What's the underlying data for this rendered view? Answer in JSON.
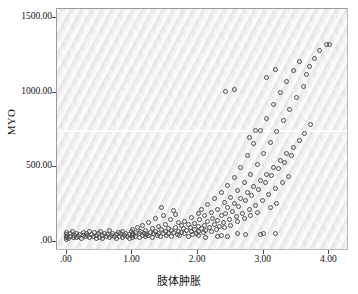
{
  "chart_data": {
    "type": "scatter",
    "title": "",
    "xlabel": "肢体肿胀",
    "ylabel": "MYO",
    "xlim": [
      -0.15,
      4.3
    ],
    "ylim": [
      -60,
      1560
    ],
    "xticks": [
      0,
      1,
      2,
      3,
      4
    ],
    "xticklabels": [
      ".00",
      "1.00",
      "2.00",
      "3.00",
      "4.00"
    ],
    "yticks": [
      0,
      500,
      1000,
      1500
    ],
    "yticklabels": [
      ".00",
      "500.00",
      "1000.00",
      "1500.00"
    ],
    "grid": false,
    "legend": null,
    "marker": "open-circle",
    "marker_color": "#4d4d4d",
    "plot_background": "#eaeaea",
    "reference_line_y": 750,
    "points": [
      [
        0.0,
        20
      ],
      [
        0.0,
        35
      ],
      [
        0.0,
        48
      ],
      [
        0.0,
        62
      ],
      [
        0.0,
        30
      ],
      [
        0.03,
        25
      ],
      [
        0.05,
        55
      ],
      [
        0.05,
        40
      ],
      [
        0.08,
        70
      ],
      [
        0.1,
        32
      ],
      [
        0.12,
        45
      ],
      [
        0.15,
        28
      ],
      [
        0.15,
        60
      ],
      [
        0.18,
        38
      ],
      [
        0.2,
        52
      ],
      [
        0.22,
        26
      ],
      [
        0.25,
        44
      ],
      [
        0.25,
        66
      ],
      [
        0.28,
        34
      ],
      [
        0.3,
        58
      ],
      [
        0.32,
        41
      ],
      [
        0.35,
        29
      ],
      [
        0.35,
        72
      ],
      [
        0.38,
        50
      ],
      [
        0.4,
        36
      ],
      [
        0.42,
        63
      ],
      [
        0.45,
        27
      ],
      [
        0.45,
        47
      ],
      [
        0.48,
        55
      ],
      [
        0.5,
        33
      ],
      [
        0.52,
        68
      ],
      [
        0.55,
        42
      ],
      [
        0.55,
        24
      ],
      [
        0.58,
        57
      ],
      [
        0.6,
        37
      ],
      [
        0.62,
        49
      ],
      [
        0.65,
        30
      ],
      [
        0.65,
        75
      ],
      [
        0.68,
        44
      ],
      [
        0.7,
        59
      ],
      [
        0.72,
        35
      ],
      [
        0.75,
        51
      ],
      [
        0.75,
        22
      ],
      [
        0.78,
        64
      ],
      [
        0.8,
        40
      ],
      [
        0.82,
        54
      ],
      [
        0.85,
        31
      ],
      [
        0.85,
        70
      ],
      [
        0.88,
        46
      ],
      [
        0.9,
        60
      ],
      [
        0.92,
        38
      ],
      [
        0.95,
        52
      ],
      [
        0.95,
        26
      ],
      [
        0.98,
        73
      ],
      [
        1.0,
        43
      ],
      [
        1.0,
        58
      ],
      [
        1.0,
        32
      ],
      [
        1.0,
        86
      ],
      [
        1.02,
        48
      ],
      [
        1.05,
        64
      ],
      [
        1.05,
        37
      ],
      [
        1.08,
        95
      ],
      [
        1.1,
        55
      ],
      [
        1.1,
        29
      ],
      [
        1.12,
        70
      ],
      [
        1.15,
        45
      ],
      [
        1.15,
        110
      ],
      [
        1.18,
        60
      ],
      [
        1.2,
        34
      ],
      [
        1.2,
        78
      ],
      [
        1.22,
        50
      ],
      [
        1.25,
        128
      ],
      [
        1.25,
        42
      ],
      [
        1.28,
        66
      ],
      [
        1.3,
        88
      ],
      [
        1.3,
        30
      ],
      [
        1.32,
        56
      ],
      [
        1.35,
        160
      ],
      [
        1.35,
        72
      ],
      [
        1.38,
        46
      ],
      [
        1.4,
        104
      ],
      [
        1.4,
        60
      ],
      [
        1.42,
        38
      ],
      [
        1.45,
        230
      ],
      [
        1.45,
        82
      ],
      [
        1.48,
        54
      ],
      [
        1.5,
        120
      ],
      [
        1.5,
        68
      ],
      [
        1.52,
        44
      ],
      [
        1.55,
        92
      ],
      [
        1.55,
        58
      ],
      [
        1.58,
        150
      ],
      [
        1.6,
        76
      ],
      [
        1.6,
        36
      ],
      [
        1.62,
        63
      ],
      [
        1.65,
        185
      ],
      [
        1.65,
        100
      ],
      [
        1.68,
        52
      ],
      [
        1.7,
        130
      ],
      [
        1.7,
        70
      ],
      [
        1.72,
        45
      ],
      [
        1.75,
        108
      ],
      [
        1.75,
        62
      ],
      [
        1.78,
        88
      ],
      [
        1.8,
        140
      ],
      [
        1.8,
        55
      ],
      [
        1.82,
        75
      ],
      [
        1.85,
        118
      ],
      [
        1.85,
        40
      ],
      [
        1.88,
        95
      ],
      [
        1.9,
        165
      ],
      [
        1.9,
        68
      ],
      [
        1.92,
        50
      ],
      [
        1.95,
        125
      ],
      [
        1.95,
        82
      ],
      [
        1.98,
        60
      ],
      [
        2.0,
        190
      ],
      [
        2.0,
        105
      ],
      [
        2.0,
        70
      ],
      [
        2.0,
        45
      ],
      [
        2.02,
        148
      ],
      [
        2.05,
        88
      ],
      [
        2.05,
        220
      ],
      [
        2.08,
        62
      ],
      [
        2.1,
        175
      ],
      [
        2.1,
        110
      ],
      [
        2.12,
        78
      ],
      [
        2.15,
        250
      ],
      [
        2.15,
        135
      ],
      [
        2.18,
        95
      ],
      [
        2.2,
        200
      ],
      [
        2.2,
        68
      ],
      [
        2.22,
        160
      ],
      [
        2.25,
        290
      ],
      [
        2.25,
        118
      ],
      [
        2.28,
        85
      ],
      [
        2.3,
        215
      ],
      [
        2.3,
        145
      ],
      [
        2.32,
        102
      ],
      [
        2.35,
        330
      ],
      [
        2.35,
        175
      ],
      [
        2.38,
        128
      ],
      [
        2.4,
        265
      ],
      [
        2.4,
        95
      ],
      [
        2.42,
        190
      ],
      [
        2.45,
        380
      ],
      [
        2.45,
        230
      ],
      [
        2.48,
        150
      ],
      [
        2.5,
        300
      ],
      [
        2.5,
        112
      ],
      [
        2.52,
        205
      ],
      [
        2.55,
        430
      ],
      [
        2.55,
        260
      ],
      [
        2.58,
        168
      ],
      [
        2.6,
        345
      ],
      [
        2.6,
        135
      ],
      [
        2.62,
        240
      ],
      [
        2.65,
        500
      ],
      [
        2.65,
        290
      ],
      [
        2.68,
        190
      ],
      [
        2.7,
        400
      ],
      [
        2.7,
        155
      ],
      [
        2.72,
        275
      ],
      [
        2.75,
        580
      ],
      [
        2.75,
        330
      ],
      [
        2.78,
        215
      ],
      [
        2.8,
        455
      ],
      [
        2.8,
        178
      ],
      [
        2.82,
        310
      ],
      [
        2.85,
        660
      ],
      [
        2.85,
        370
      ],
      [
        2.88,
        245
      ],
      [
        2.9,
        520
      ],
      [
        2.9,
        200
      ],
      [
        2.92,
        355
      ],
      [
        2.95,
        745
      ],
      [
        2.95,
        410
      ],
      [
        2.98,
        280
      ],
      [
        3.0,
        590
      ],
      [
        3.0,
        60
      ],
      [
        3.02,
        400
      ],
      [
        3.05,
        830
      ],
      [
        3.05,
        455
      ],
      [
        3.08,
        320
      ],
      [
        3.1,
        665
      ],
      [
        3.1,
        230
      ],
      [
        3.12,
        445
      ],
      [
        3.15,
        920
      ],
      [
        3.15,
        500
      ],
      [
        3.18,
        360
      ],
      [
        3.2,
        740
      ],
      [
        3.2,
        255
      ],
      [
        3.22,
        490
      ],
      [
        3.25,
        1000
      ],
      [
        3.25,
        545
      ],
      [
        3.28,
        400
      ],
      [
        3.3,
        815
      ],
      [
        3.32,
        535
      ],
      [
        3.35,
        1075
      ],
      [
        3.35,
        590
      ],
      [
        3.38,
        440
      ],
      [
        3.4,
        890
      ],
      [
        3.42,
        580
      ],
      [
        3.45,
        1150
      ],
      [
        3.45,
        635
      ],
      [
        3.5,
        965
      ],
      [
        3.55,
        1210
      ],
      [
        3.55,
        680
      ],
      [
        3.6,
        1040
      ],
      [
        3.62,
        725
      ],
      [
        3.65,
        1120
      ],
      [
        3.7,
        1175
      ],
      [
        3.72,
        790
      ],
      [
        3.78,
        1230
      ],
      [
        3.85,
        1285
      ],
      [
        3.95,
        1320
      ],
      [
        4.0,
        1320
      ],
      [
        2.42,
        1005
      ],
      [
        2.55,
        1020
      ],
      [
        3.05,
        1100
      ],
      [
        3.18,
        1155
      ],
      [
        2.78,
        700
      ],
      [
        2.88,
        745
      ],
      [
        2.3,
        35
      ],
      [
        2.45,
        40
      ],
      [
        2.6,
        55
      ],
      [
        2.72,
        48
      ],
      [
        2.95,
        52
      ],
      [
        3.18,
        58
      ],
      [
        2.12,
        28
      ],
      [
        2.35,
        42
      ],
      [
        1.62,
        210
      ],
      [
        1.48,
        175
      ]
    ]
  }
}
